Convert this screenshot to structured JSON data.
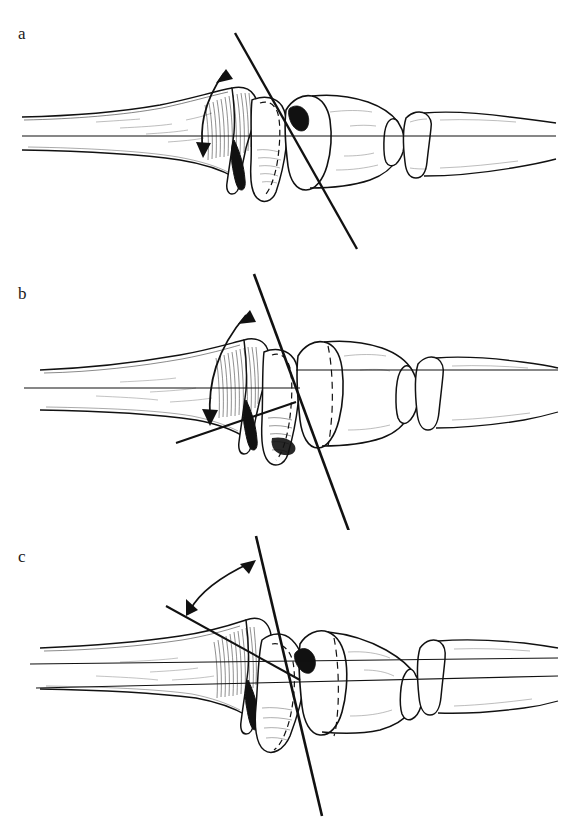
{
  "figure": {
    "background_color": "#ffffff",
    "ink_color": "#111111",
    "width": 563,
    "height": 830,
    "panel_count": 3,
    "view": "lateral (sagittal) line drawing",
    "structures_depicted": [
      "metacarpal shaft",
      "metacarpal head",
      "proximal phalanx base",
      "proximal phalanx shaft",
      "middle phalanx",
      "sesamoid / volar plate outline"
    ],
    "line_types": [
      "solid long axis line",
      "solid oblique articular axis line",
      "dashed hidden contour line",
      "curved arc with double arrowheads"
    ]
  },
  "panels": [
    {
      "id": "a",
      "label": "a",
      "label_x": 18,
      "label_y": 32,
      "origin_y": 0,
      "description": "Joint in neutral extension; oblique axis crosses the long axis at an acute angle opening proximally",
      "angle_arc": {
        "label": "flexion angle arc",
        "arrow_heads": 2,
        "open_direction": "proximal-superior"
      },
      "long_axis": {
        "label": "long axis of metacarpal",
        "style": "solid"
      },
      "oblique_axis": {
        "label": "oblique joint axis",
        "style": "solid"
      },
      "dashed_contour": {
        "label": "hidden condyle outline",
        "style": "dashed"
      }
    },
    {
      "id": "b",
      "label": "b",
      "label_x": 18,
      "label_y": 293,
      "origin_y": 260,
      "description": "Joint in partial flexion; oblique axis rotated so the arc subtends a larger angle",
      "angle_arc": {
        "label": "flexion angle arc",
        "arrow_heads": 2,
        "open_direction": "proximal-superior"
      },
      "long_axis": {
        "label": "long axis of metacarpal",
        "style": "solid"
      },
      "oblique_axis": {
        "label": "oblique joint axis",
        "style": "solid"
      },
      "dashed_contour": {
        "label": "hidden condyle outline",
        "style": "dashed"
      }
    },
    {
      "id": "c",
      "label": "c",
      "label_x": 18,
      "label_y": 556,
      "origin_y": 520,
      "description": "Joint in full flexion; the two reference lines cross distally and the arc is widest",
      "angle_arc": {
        "label": "flexion angle arc",
        "arrow_heads": 2,
        "open_direction": "proximal-superior"
      },
      "long_axis": {
        "label": "long axis of metacarpal",
        "style": "solid"
      },
      "oblique_axis": {
        "label": "oblique joint axis",
        "style": "solid"
      },
      "dashed_contour": {
        "label": "hidden condyle outline",
        "style": "dashed"
      }
    }
  ]
}
